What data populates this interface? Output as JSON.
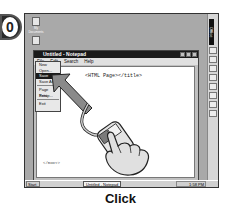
{
  "step": {
    "number": "10"
  },
  "desktop": {
    "icons": [
      {
        "label": "My Documents",
        "icon": "folder-icon"
      },
      {
        "label": "My Computer",
        "icon": "computer-icon"
      }
    ]
  },
  "office_bar": {
    "label": "Office"
  },
  "notepad": {
    "title": "Untitled - Notepad",
    "menu": [
      "File",
      "Edit",
      "Search",
      "Help"
    ],
    "content": "<HTML Page></title>",
    "content_tail": "</BODY>"
  },
  "file_menu": {
    "items": [
      "New",
      "Open...",
      "Save",
      "Save As...",
      "Page Setup...",
      "Print",
      "Exit"
    ],
    "selected": "Save"
  },
  "taskbar": {
    "start": "Start",
    "task": "Untitled - Notepad",
    "clock": "1:58 PM"
  },
  "caption": "Click"
}
